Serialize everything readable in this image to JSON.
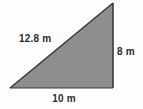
{
  "figure": {
    "kind": "right-triangle-diagram",
    "background_color": "#fefefe",
    "fill_color": "#8e8e8e",
    "edge_color": "#3a3a3a",
    "label_color": "#2b2b2b",
    "labels": {
      "hypotenuse": "12.8 m",
      "vertical_leg": "8 m",
      "base_leg": "10 m"
    },
    "geometry": {
      "bottom_left": "10,88",
      "bottom_right": "113,88",
      "top_right": "113,3"
    }
  }
}
